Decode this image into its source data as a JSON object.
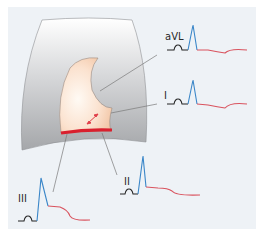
{
  "diagram": {
    "colors": {
      "background": "#eef2f6",
      "heart_wall_top": "#ffffff",
      "heart_wall_bottom": "#a9abae",
      "ventricle_light": "#fff6ee",
      "ventricle_dark": "#f4cdb0",
      "infarct_band": "#d9202e",
      "arrow": "#e0404a",
      "pointer": "#777777",
      "ecg_baseline": "#222222",
      "ecg_qrs": "#3a86c8",
      "ecg_st": "#d9535e"
    },
    "leads": [
      {
        "id": "aVL",
        "label": "aVL",
        "st_change": "depression"
      },
      {
        "id": "I",
        "label": "I",
        "st_change": "depression"
      },
      {
        "id": "II",
        "label": "II",
        "st_change": "elevation"
      },
      {
        "id": "III",
        "label": "III",
        "st_change": "elevation"
      }
    ]
  }
}
